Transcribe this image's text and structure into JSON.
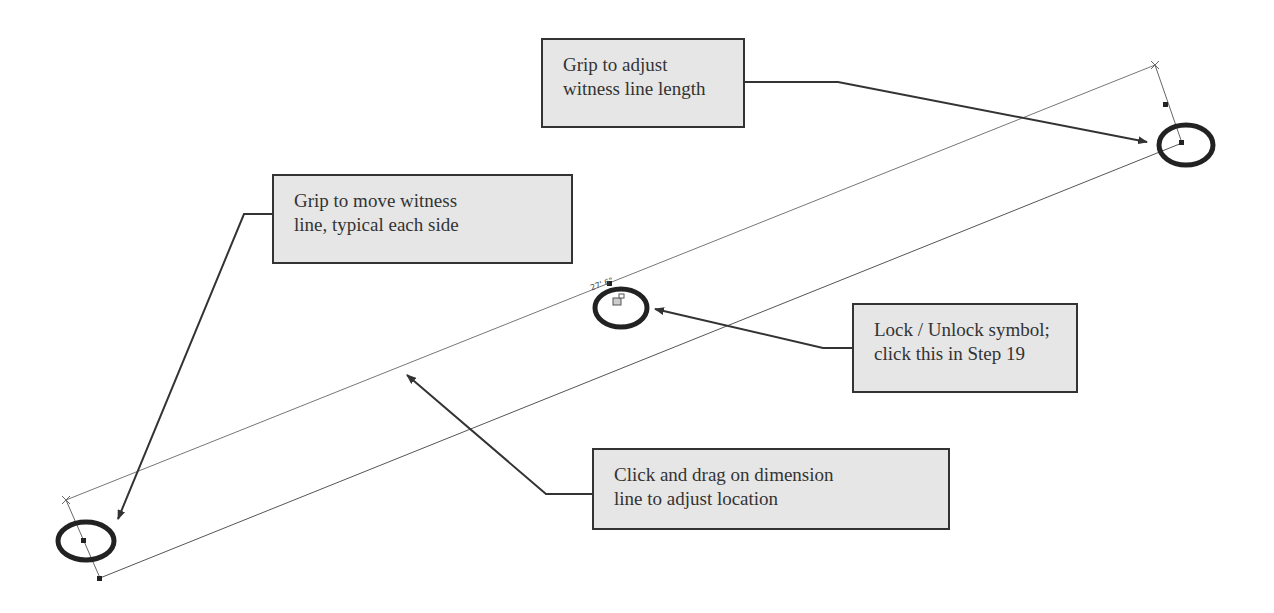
{
  "callouts": {
    "witness_length": {
      "line1": "Grip to adjust",
      "line2": "witness line length"
    },
    "move_witness": {
      "line1": "Grip to move witness",
      "line2": "line, typical each side"
    },
    "lock_unlock": {
      "line1": "Lock / Unlock symbol;",
      "line2": "click this in Step 19"
    },
    "drag_dimension": {
      "line1": "Click and drag on dimension",
      "line2": "line to adjust location"
    }
  },
  "dimension": {
    "label": "27' 6\""
  },
  "colors": {
    "callout_bg": "#e6e6e6",
    "callout_border": "#333333",
    "arrow": "#333333",
    "drawing_line": "#555555"
  }
}
